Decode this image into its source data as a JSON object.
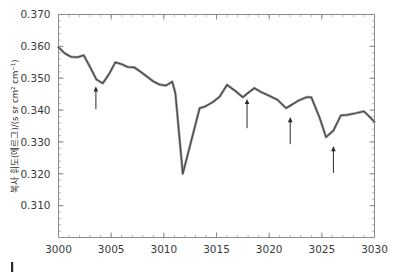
{
  "figure": {
    "caret_marker": "|",
    "background_color": "#ffffff",
    "line_color": "#4a4a4a",
    "halo_color": "#9c9c9c",
    "axis_color": "#8a8a8a",
    "arrow_color": "#2b2b2b"
  },
  "chart_data": {
    "type": "line",
    "title": "",
    "subtitle": "",
    "xlabel": "",
    "ylabel": "복사 휘도(에르그)/(s sr cm² cm⁻¹)",
    "xlim": [
      3000,
      3030
    ],
    "ylim": [
      0.3,
      0.37
    ],
    "xticks": [
      3000,
      3005,
      3010,
      3015,
      3020,
      3025,
      3030
    ],
    "xticklabels": [
      "3000",
      "3005",
      "3010",
      "3015",
      "3020",
      "3025",
      "3030"
    ],
    "yticks": [
      0.31,
      0.32,
      0.33,
      0.34,
      0.35,
      0.36,
      0.37
    ],
    "yticklabels": [
      "0.310",
      "0.320",
      "0.330",
      "0.340",
      "0.350",
      "0.360",
      "0.370"
    ],
    "x_minor_tick_interval": 1,
    "y_minor_tick_interval": 0.002,
    "grid": false,
    "legend": null,
    "legend_position": "none",
    "series": [
      {
        "name": "radiance",
        "x": [
          3000.0,
          3000.6,
          3001.2,
          3001.8,
          3002.4,
          3003.0,
          3003.6,
          3004.2,
          3004.8,
          3005.4,
          3006.0,
          3006.6,
          3007.2,
          3007.8,
          3008.4,
          3009.0,
          3009.6,
          3010.2,
          3010.8,
          3011.1,
          3011.8,
          3012.6,
          3013.4,
          3013.9,
          3014.6,
          3015.3,
          3016.0,
          3016.8,
          3017.5,
          3017.9,
          3018.6,
          3019.2,
          3020.0,
          3020.8,
          3021.6,
          3022.0,
          3022.8,
          3023.6,
          3024.0,
          3024.8,
          3025.4,
          3026.1,
          3026.8,
          3027.4,
          3028.2,
          3029.0,
          3029.5,
          3030.0
        ],
        "y": [
          0.3597,
          0.3578,
          0.3567,
          0.3566,
          0.3572,
          0.3535,
          0.3496,
          0.3484,
          0.3513,
          0.355,
          0.3544,
          0.3535,
          0.3534,
          0.352,
          0.3505,
          0.349,
          0.348,
          0.3477,
          0.3489,
          0.3452,
          0.32,
          0.3303,
          0.3406,
          0.3411,
          0.3424,
          0.3442,
          0.3479,
          0.346,
          0.344,
          0.3451,
          0.3469,
          0.3457,
          0.3445,
          0.3432,
          0.3406,
          0.3414,
          0.343,
          0.3441,
          0.344,
          0.3375,
          0.3315,
          0.3336,
          0.3383,
          0.3385,
          0.339,
          0.3396,
          0.338,
          0.3363
        ]
      }
    ],
    "annotations": [
      {
        "type": "arrow",
        "x": 3003.55,
        "y_head": 0.3475,
        "y_tail": 0.3403,
        "label": ""
      },
      {
        "type": "arrow",
        "x": 3017.9,
        "y_head": 0.3435,
        "y_tail": 0.3343,
        "label": ""
      },
      {
        "type": "arrow",
        "x": 3022.0,
        "y_head": 0.3378,
        "y_tail": 0.3293,
        "label": ""
      },
      {
        "type": "arrow",
        "x": 3026.1,
        "y_head": 0.3287,
        "y_tail": 0.3203,
        "label": ""
      }
    ]
  }
}
